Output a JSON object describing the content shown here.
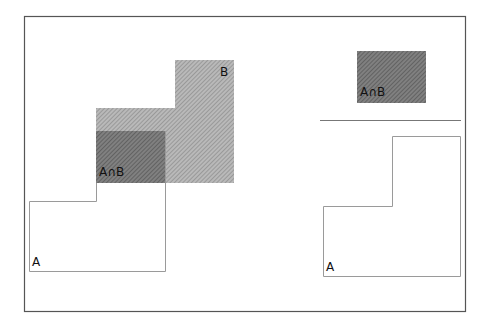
{
  "diagram": {
    "left_panel": {
      "shape_a_label": "A",
      "shape_b_label": "B",
      "intersection_label": "A∩B"
    },
    "right_panel": {
      "intersection_label": "A∩B",
      "shape_a_label": "A"
    },
    "colors": {
      "frame": "#555555",
      "outline": "#9a9a9a",
      "b_fill": "#a8a8a8",
      "intersection_fill": "#6e6e6e",
      "divider": "#777777"
    }
  }
}
